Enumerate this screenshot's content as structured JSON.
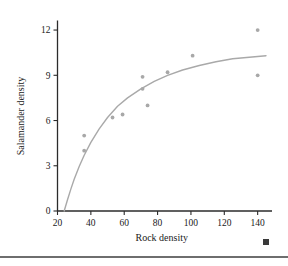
{
  "chart_data": {
    "type": "scatter",
    "title": "",
    "xlabel": "Rock density",
    "ylabel": "Salamander density",
    "xlim": [
      20,
      145
    ],
    "ylim": [
      0,
      12.6
    ],
    "xticks": [
      20,
      40,
      60,
      80,
      100,
      120,
      140
    ],
    "yticks": [
      0,
      3,
      6,
      9,
      12
    ],
    "xtick_labels": [
      "20",
      "40",
      "60",
      "80",
      "100",
      "120",
      "140"
    ],
    "ytick_labels": [
      "0",
      "3",
      "6",
      "9",
      "12"
    ],
    "grid": false,
    "legend": false,
    "points": [
      {
        "x": 36,
        "y": 5.0
      },
      {
        "x": 36,
        "y": 4.0
      },
      {
        "x": 53,
        "y": 6.2
      },
      {
        "x": 59,
        "y": 6.4
      },
      {
        "x": 71,
        "y": 8.9
      },
      {
        "x": 71,
        "y": 8.1
      },
      {
        "x": 74,
        "y": 7.0
      },
      {
        "x": 86,
        "y": 9.2
      },
      {
        "x": 101,
        "y": 10.3
      },
      {
        "x": 140,
        "y": 12.0
      },
      {
        "x": 140,
        "y": 9.0
      }
    ],
    "series": [
      {
        "name": "fitted curve",
        "type": "line",
        "x": [
          24,
          26,
          28,
          30,
          33,
          36,
          40,
          45,
          50,
          56,
          62,
          70,
          78,
          86,
          95,
          105,
          115,
          125,
          135,
          145
        ],
        "y": [
          0.0,
          0.75,
          1.45,
          2.1,
          2.95,
          3.7,
          4.55,
          5.45,
          6.2,
          6.95,
          7.5,
          8.1,
          8.6,
          9.0,
          9.35,
          9.65,
          9.9,
          10.1,
          10.2,
          10.3
        ]
      }
    ],
    "colors": {
      "point": "#a8a8a8",
      "curve": "#a9a9a9",
      "axis": "#2b2b2b",
      "text": "#1a1a1a",
      "footer_rule": "#6e6e6e",
      "corner_square": "#3a3a3a"
    }
  },
  "decorations": {
    "corner_square_name": "page-corner-marker",
    "footer_rule_name": "footer-divider"
  }
}
